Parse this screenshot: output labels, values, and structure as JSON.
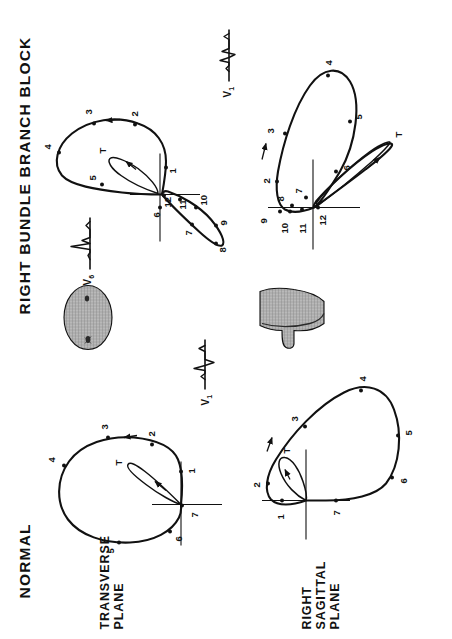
{
  "figure": {
    "columns": [
      {
        "id": "normal",
        "title": "NORMAL",
        "title_visible": true
      },
      {
        "id": "rbbb",
        "title": "RIGHT  BUNDLE  BRANCH  BLOCK",
        "title_visible": true
      }
    ],
    "rows": [
      {
        "id": "transverse",
        "label": "TRANSVERSE\nPLANE"
      },
      {
        "id": "sagittal",
        "label": "RIGHT\nSAGITTAL\nPLANE"
      }
    ],
    "lead_labels": {
      "v1": "V",
      "v1_sub": "1",
      "v6": "V",
      "v6_sub": "6"
    }
  },
  "panels": {
    "normal_transverse": {
      "lead": "V1",
      "point_labels": [
        "1",
        "2",
        "3",
        "4",
        "5",
        "6",
        "7",
        "T"
      ],
      "direction": "counterclockwise",
      "arrow_count": 2
    },
    "normal_sagittal": {
      "lead": "",
      "point_labels": [
        "1",
        "2",
        "3",
        "4",
        "5",
        "6",
        "7",
        "T"
      ],
      "direction": "clockwise",
      "arrow_count": 2
    },
    "rbbb_transverse": {
      "lead": "V6",
      "lead_secondary": "V1",
      "point_labels": [
        "1",
        "2",
        "3",
        "4",
        "5",
        "6",
        "7",
        "8",
        "9",
        "10",
        "11",
        "12",
        "T"
      ],
      "direction": "counterclockwise",
      "arrow_count": 2
    },
    "rbbb_sagittal": {
      "lead": "",
      "point_labels": [
        "2",
        "3",
        "4",
        "5",
        "6",
        "7",
        "8",
        "9",
        "10",
        "11",
        "12",
        "T"
      ],
      "direction": "clockwise",
      "arrow_count": 2
    }
  },
  "torso_diagrams": [
    {
      "id": "torso-transverse-section",
      "orientation": "transverse cross-section"
    },
    {
      "id": "torso-sagittal-section",
      "orientation": "sagittal silhouette"
    }
  ],
  "colors": {
    "ink": "#111111",
    "paper": "#ffffff",
    "torso_fill": "#9a9a9a"
  }
}
